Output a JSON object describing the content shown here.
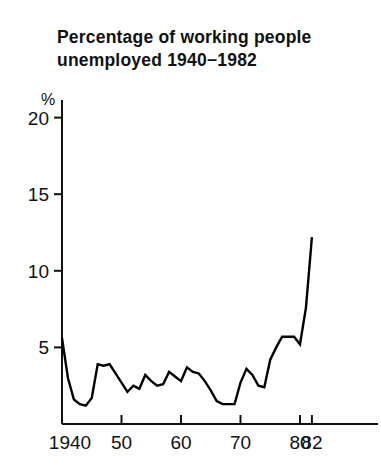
{
  "chart": {
    "title": "Percentage of working people\nunemployed 1940−1982",
    "unit_label": "%"
  },
  "chart_data": {
    "type": "line",
    "xlabel": "",
    "ylabel": "%",
    "grid": false,
    "legend": null,
    "xlim": [
      1940,
      1982
    ],
    "ylim": [
      0,
      21
    ],
    "ytick_labels": [
      "5",
      "10",
      "15",
      "20"
    ],
    "ytick_values": [
      5,
      10,
      15,
      20
    ],
    "xtick_labels": [
      "1940",
      "50",
      "60",
      "70",
      "80",
      "82"
    ],
    "xtick_values": [
      1940,
      1950,
      1960,
      1970,
      1980,
      1982
    ],
    "series": [
      {
        "name": "Unemployment rate",
        "color": "#000000",
        "x": [
          1940,
          1941,
          1942,
          1943,
          1944,
          1945,
          1946,
          1947,
          1948,
          1949,
          1950,
          1951,
          1952,
          1953,
          1954,
          1955,
          1956,
          1957,
          1958,
          1959,
          1960,
          1961,
          1962,
          1963,
          1964,
          1965,
          1966,
          1967,
          1968,
          1969,
          1970,
          1971,
          1972,
          1973,
          1974,
          1975,
          1976,
          1977,
          1978,
          1979,
          1980,
          1981,
          1982
        ],
        "values": [
          5.6,
          3.0,
          1.6,
          1.3,
          1.2,
          1.7,
          3.9,
          3.8,
          3.9,
          3.3,
          2.7,
          2.1,
          2.5,
          2.3,
          3.2,
          2.8,
          2.5,
          2.6,
          3.4,
          3.1,
          2.8,
          3.7,
          3.4,
          3.3,
          2.8,
          2.2,
          1.5,
          1.3,
          1.3,
          1.3,
          2.7,
          3.6,
          3.2,
          2.5,
          2.4,
          4.2,
          5.0,
          5.7,
          5.7,
          5.7,
          5.2,
          7.6,
          12.2
        ]
      }
    ]
  }
}
